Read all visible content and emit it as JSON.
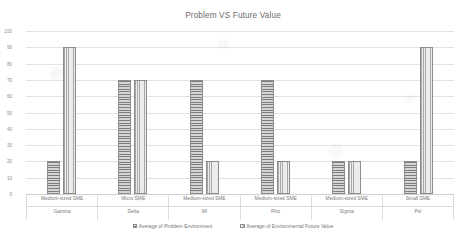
{
  "chart_data": {
    "type": "bar",
    "title": "Problem VS Future Value",
    "xlabel": "",
    "ylabel": "",
    "ylim": [
      0,
      100
    ],
    "yticks": [
      0,
      10,
      20,
      30,
      40,
      50,
      60,
      70,
      80,
      90,
      100
    ],
    "grid": true,
    "legend_position": "bottom",
    "categories": [
      "Medium-sized SME\nGamma",
      "Micro SME\nDelta",
      "Medium-sized SME\nMI",
      "Medium-sized SME\nRho",
      "Medium-sized SME\nSigma",
      "Small SME\nPsi"
    ],
    "category_rows": [
      {
        "size": "Medium-sized SME",
        "name": "Gamma"
      },
      {
        "size": "Micro SME",
        "name": "Delta"
      },
      {
        "size": "Medium-sized SME",
        "name": "MI"
      },
      {
        "size": "Medium-sized SME",
        "name": "Rho"
      },
      {
        "size": "Medium-sized SME",
        "name": "Sigma"
      },
      {
        "size": "Small SME",
        "name": "Psi"
      }
    ],
    "series": [
      {
        "name": "Average of Problem Environment",
        "values": [
          20,
          70,
          70,
          70,
          20,
          20
        ],
        "pattern": "horizontal-stripes",
        "color": "#9b9b9b"
      },
      {
        "name": "Average of Environmental Future Value",
        "values": [
          90,
          70,
          20,
          20,
          20,
          90
        ],
        "pattern": "vertical-stripes",
        "color": "#d0d0d0"
      }
    ]
  },
  "axis": {
    "tick_labels": [
      "100",
      "90",
      "80",
      "70",
      "60",
      "50",
      "40",
      "30",
      "20",
      "10",
      "0"
    ]
  },
  "legend": {
    "entries": [
      "Average of Problem Environment",
      "Average of Environmental Future Value"
    ]
  },
  "colors": {
    "gridline": "#e2e2e2",
    "text": "#6f6f6f",
    "series_problem": "#9b9b9b",
    "series_future": "#d0d0d0"
  }
}
